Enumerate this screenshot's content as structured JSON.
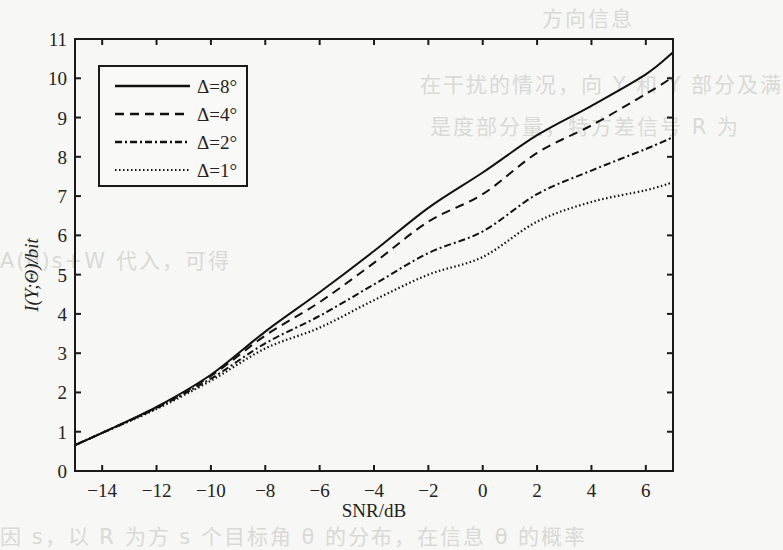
{
  "chart_data": {
    "type": "line",
    "title": "",
    "xlabel": "SNR/dB",
    "ylabel": "I(Y;Θ)/bit",
    "xlim": [
      -15,
      7
    ],
    "ylim": [
      0,
      11
    ],
    "xticks": [
      -14,
      -12,
      -10,
      -8,
      -6,
      -4,
      -2,
      0,
      2,
      4,
      6
    ],
    "xtick_labels": [
      "−14",
      "−12",
      "−10",
      "−8",
      "−6",
      "−4",
      "−2",
      "0",
      "2",
      "4",
      "6"
    ],
    "yticks": [
      0,
      1,
      2,
      3,
      4,
      5,
      6,
      7,
      8,
      9,
      10,
      11
    ],
    "ytick_labels": [
      "0",
      "1",
      "2",
      "3",
      "4",
      "5",
      "6",
      "7",
      "8",
      "9",
      "10",
      "11"
    ],
    "grid": false,
    "legend_position": "upper left",
    "x": [
      -15,
      -14,
      -12,
      -10,
      -8,
      -6,
      -4,
      -2,
      0,
      2,
      4,
      6,
      7
    ],
    "series": [
      {
        "name": "Δ=8°",
        "style": "solid",
        "values": [
          0.66,
          0.97,
          1.63,
          2.45,
          3.55,
          4.55,
          5.6,
          6.7,
          7.6,
          8.55,
          9.3,
          10.1,
          10.66
        ]
      },
      {
        "name": "Δ=4°",
        "style": "dashed",
        "values": [
          0.66,
          0.97,
          1.62,
          2.42,
          3.45,
          4.3,
          5.3,
          6.35,
          7.05,
          8.1,
          8.8,
          9.6,
          10.03
        ]
      },
      {
        "name": "Δ=2°",
        "style": "dashdot",
        "values": [
          0.66,
          0.97,
          1.6,
          2.35,
          3.25,
          3.95,
          4.75,
          5.55,
          6.1,
          7.05,
          7.65,
          8.2,
          8.5
        ]
      },
      {
        "name": "Δ=1°",
        "style": "dotted",
        "values": [
          0.66,
          0.97,
          1.58,
          2.3,
          3.12,
          3.65,
          4.35,
          5.0,
          5.45,
          6.35,
          6.85,
          7.15,
          7.35
        ]
      }
    ]
  },
  "colors": {
    "line": "#111111",
    "axis": "#1a1a1a",
    "background": "#f7f7f5",
    "bleed_text": "#d9d9d6"
  },
  "bleed_text": [
    {
      "text": "方向信息",
      "x": 542,
      "y": 2
    },
    {
      "text": "在干扰的情况，向 Y 和 Y 部分及满",
      "x": 420,
      "y": 68
    },
    {
      "text": "是度部分量，特方差信号 R 为",
      "x": 430,
      "y": 110
    },
    {
      "text": "A(θ)s+W 代入，可得",
      "x": 0,
      "y": 244
    },
    {
      "text": "因 s，以 R 为方 s 个目标角 θ 的分布，在信息 θ 的概率",
      "x": 0,
      "y": 520
    }
  ]
}
